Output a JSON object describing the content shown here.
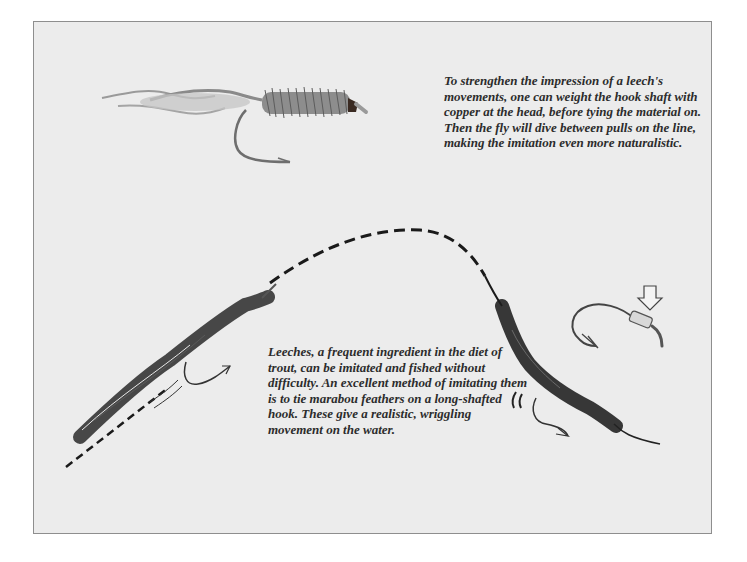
{
  "page": {
    "background": "#ffffff",
    "panel_color": "#ececec",
    "border_color": "#8e8e8e"
  },
  "captions": {
    "top": "To strengthen the impression of a leech's movements, one can weight the hook shaft with copper at the head, before tying the material on. Then the fly will dive between pulls on the line, making the imitation even more naturalistic.",
    "middle": "Leeches, a frequent ingredient in the diet of trout, can be imitated and fished without difficulty. An excellent method of imitating them is to tie marabou feathers on a long-shafted hook. These give a realistic, wriggling movement on the water."
  },
  "illustrations": [
    {
      "name": "weighted-leech-fly",
      "description": "marabou leech fly with copper-weighted head"
    },
    {
      "name": "leech-fly-on-line-left",
      "description": "leech fly diving on dashed line"
    },
    {
      "name": "leech-fly-on-line-right",
      "description": "leech fly wriggling at end of line"
    },
    {
      "name": "weighted-hook",
      "description": "hook with copper wire wraps, arrow pointing to weight"
    }
  ]
}
